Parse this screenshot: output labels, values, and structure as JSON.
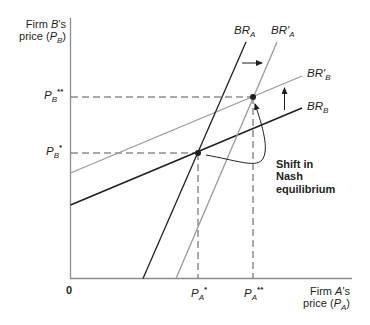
{
  "axes": {
    "y_title_line1_pre": "Firm ",
    "y_title_line1_var": "B",
    "y_title_line1_post": "’s",
    "y_title_line2_pre": "price (",
    "y_title_line2_var": "P",
    "y_title_line2_sub": "B",
    "y_title_line2_post": ")",
    "x_title_line1_pre": "Firm ",
    "x_title_line1_var": "A",
    "x_title_line1_post": "'s",
    "x_title_line2_pre": "price (",
    "x_title_line2_var": "P",
    "x_title_line2_sub": "A",
    "x_title_line2_post": ")",
    "origin": "0"
  },
  "ticks": {
    "y": [
      {
        "base": "P",
        "sub": "B",
        "sup": "**"
      },
      {
        "base": "P",
        "sub": "B",
        "sup": "*"
      }
    ],
    "x": [
      {
        "base": "P",
        "sub": "A",
        "sup": "*"
      },
      {
        "base": "P",
        "sub": "A",
        "sup": "**"
      }
    ]
  },
  "curves": {
    "br_a": {
      "base": "BR",
      "sub": "A",
      "prime": ""
    },
    "br_a_prime": {
      "base": "BR",
      "sub": "A",
      "prime": "′"
    },
    "br_b_prime": {
      "base": "BR",
      "sub": "B",
      "prime": "′"
    },
    "br_b": {
      "base": "BR",
      "sub": "B",
      "prime": ""
    }
  },
  "annotation": {
    "line1": "Shift in",
    "line2": "Nash",
    "line3": "equilibrium"
  },
  "colors": {
    "dark_line": "#231f20",
    "gray_line": "#9a9a9a",
    "axis": "#8c8c8c",
    "dash": "#555555"
  }
}
